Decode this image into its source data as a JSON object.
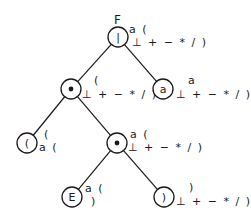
{
  "diagram": {
    "title": "F",
    "nodes": [
      {
        "id": "n1",
        "symbol": "|",
        "kind": "text",
        "cx": 118,
        "cy": 37,
        "annot_top": "a (",
        "annot_bottom": "⊥ + − * / )",
        "top_x": 129,
        "top_y": 33,
        "bottom_x": 132,
        "bottom_y": 46
      },
      {
        "id": "n2",
        "symbol": "•",
        "kind": "dot",
        "cx": 71,
        "cy": 89,
        "annot_top": "(",
        "annot_bottom": "⊥ + − * / )",
        "top_x": 94,
        "top_y": 84,
        "bottom_x": 82,
        "bottom_y": 98
      },
      {
        "id": "n3",
        "symbol": "a",
        "kind": "text",
        "cx": 163,
        "cy": 89,
        "annot_top": "a",
        "annot_bottom": "⊥ + − * / )",
        "top_x": 188,
        "top_y": 84,
        "bottom_x": 176,
        "bottom_y": 98
      },
      {
        "id": "n4",
        "symbol": "(",
        "kind": "text",
        "cx": 27,
        "cy": 143,
        "annot_top": "(",
        "annot_bottom": "a (",
        "top_x": 44,
        "top_y": 138,
        "bottom_x": 39,
        "bottom_y": 151
      },
      {
        "id": "n5",
        "symbol": "•",
        "kind": "dot",
        "cx": 117,
        "cy": 143,
        "annot_top": "a (",
        "annot_bottom": "⊥ + − * / )",
        "top_x": 130,
        "top_y": 138,
        "bottom_x": 128,
        "bottom_y": 151
      },
      {
        "id": "n6",
        "symbol": "E",
        "kind": "text",
        "cx": 72,
        "cy": 197,
        "annot_top": "a (",
        "annot_bottom": ")",
        "top_x": 85,
        "top_y": 192,
        "bottom_x": 91,
        "bottom_y": 205
      },
      {
        "id": "n7",
        "symbol": ")",
        "kind": "text",
        "cx": 164,
        "cy": 197,
        "annot_top": ")",
        "annot_bottom": "⊥ + − * / )",
        "top_x": 189,
        "top_y": 191,
        "bottom_x": 176,
        "bottom_y": 205
      }
    ],
    "edges": [
      {
        "from": "n1",
        "to": "n2"
      },
      {
        "from": "n1",
        "to": "n3"
      },
      {
        "from": "n2",
        "to": "n4"
      },
      {
        "from": "n2",
        "to": "n5"
      },
      {
        "from": "n5",
        "to": "n6"
      },
      {
        "from": "n5",
        "to": "n7"
      }
    ],
    "radius": 10,
    "colors": {
      "stroke": "#1a1a1a",
      "background": "#ffffff"
    }
  }
}
